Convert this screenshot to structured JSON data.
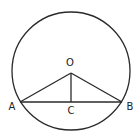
{
  "diagram": {
    "type": "circle-chord-geometry",
    "colors": {
      "background": "#ffffff",
      "stroke": "#2a2a2a",
      "text": "#222222"
    },
    "circle": {
      "cx": 71,
      "cy": 71,
      "r": 59
    },
    "points": {
      "O": {
        "label": "O",
        "x": 71,
        "y": 73,
        "label_x": 70,
        "label_y": 63
      },
      "A": {
        "label": "A",
        "x": 20,
        "y": 102,
        "label_x": 12,
        "label_y": 107
      },
      "B": {
        "label": "B",
        "x": 122,
        "y": 102,
        "label_x": 130,
        "label_y": 107
      },
      "C": {
        "label": "C",
        "x": 71,
        "y": 102,
        "label_x": 71,
        "label_y": 111
      }
    },
    "segments": [
      {
        "name": "OA",
        "from": "O",
        "to": "A"
      },
      {
        "name": "OB",
        "from": "O",
        "to": "B"
      },
      {
        "name": "OC",
        "from": "O",
        "to": "C"
      },
      {
        "name": "AB",
        "from": "A",
        "to": "B"
      }
    ]
  }
}
